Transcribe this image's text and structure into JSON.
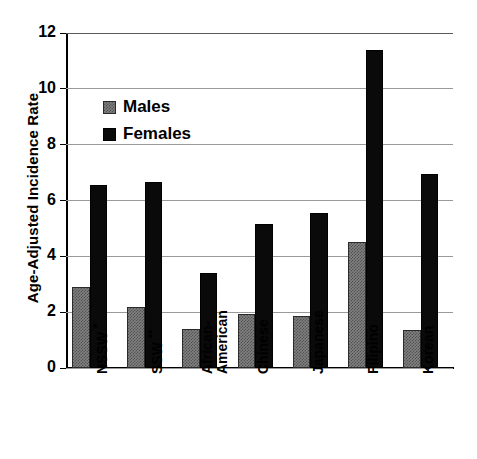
{
  "chart_data": {
    "type": "bar",
    "title": "",
    "xlabel": "",
    "ylabel": "Age-Adjusted Incidence Rate",
    "ylim": [
      0,
      12
    ],
    "yticks": [
      0,
      2,
      4,
      6,
      8,
      10,
      12
    ],
    "grid": true,
    "legend_position": "upper-left-inside",
    "categories": [
      "NSSW *",
      "SSW **",
      "African-American",
      "Chinese",
      "Japanese",
      "Filipino",
      "Korean"
    ],
    "category_lines": [
      [
        "NSSW",
        "*"
      ],
      [
        "SSW",
        "**"
      ],
      [
        "African-",
        "American"
      ],
      [
        "Chinese",
        ""
      ],
      [
        "Japanese",
        ""
      ],
      [
        "Filipino",
        ""
      ],
      [
        "Korean",
        ""
      ]
    ],
    "series": [
      {
        "name": "Males",
        "color": "#808080",
        "values": [
          2.9,
          2.2,
          1.4,
          1.95,
          1.85,
          4.5,
          1.35
        ]
      },
      {
        "name": "Females",
        "color": "#000000",
        "values": [
          6.55,
          6.65,
          3.4,
          5.15,
          5.55,
          11.4,
          6.95
        ]
      }
    ]
  },
  "axis": {
    "y_title": "Age-Adjusted Incidence Rate",
    "y_tick_labels": [
      "12",
      "10",
      "8",
      "6",
      "4",
      "2",
      "0"
    ]
  },
  "legend": {
    "items": [
      {
        "label": "Males",
        "swatch": "gray-hatched-swatch"
      },
      {
        "label": "Females",
        "swatch": "black-swatch"
      }
    ]
  },
  "xticks": {
    "labels": [
      {
        "line1": "NSSW",
        "line2": "",
        "marker": "*"
      },
      {
        "line1": "SSW",
        "line2": "",
        "marker": "**"
      },
      {
        "line1": "African-",
        "line2": "American",
        "marker": ""
      },
      {
        "line1": "Chinese",
        "line2": "",
        "marker": ""
      },
      {
        "line1": "Japanese",
        "line2": "",
        "marker": ""
      },
      {
        "line1": "Filipino",
        "line2": "",
        "marker": ""
      },
      {
        "line1": "Korean",
        "line2": "",
        "marker": ""
      }
    ]
  }
}
